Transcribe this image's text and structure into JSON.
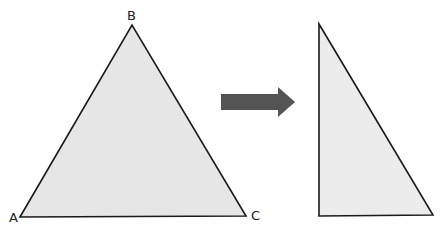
{
  "colors": {
    "triangle_fill": "#e6e6e6",
    "triangle_stroke": "#1a1a1a",
    "arrow_fill": "#545454",
    "label_color": "#222222"
  },
  "triangle_original": {
    "vertices": {
      "A": {
        "label": "A",
        "x": 20,
        "y": 217
      },
      "B": {
        "label": "B",
        "x": 132,
        "y": 25
      },
      "C": {
        "label": "C",
        "x": 246,
        "y": 216
      }
    }
  },
  "arrow": {
    "direction": "right",
    "icon": "right-arrow-icon"
  },
  "triangle_result": {
    "shape": "right triangle",
    "vertices": [
      {
        "x": 319,
        "y": 24
      },
      {
        "x": 319,
        "y": 216
      },
      {
        "x": 433,
        "y": 215
      }
    ]
  }
}
